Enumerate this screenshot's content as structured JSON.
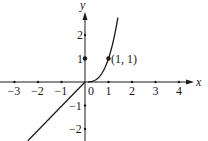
{
  "chart_data": {
    "type": "line",
    "title": "",
    "xlabel": "x",
    "ylabel": "y",
    "xlim": [
      -3.6,
      4.7
    ],
    "ylim": [
      -2.5,
      3.3
    ],
    "grid": false,
    "legend": null,
    "x_ticks": [
      -3,
      -2,
      -1,
      1,
      2,
      3,
      4
    ],
    "x_tick_labels": [
      "−3",
      "−2",
      "−1",
      "1",
      "2",
      "3",
      "4"
    ],
    "y_ticks": [
      2,
      1,
      -1,
      -2
    ],
    "y_tick_labels": [
      "2",
      "1",
      "−1",
      "−2"
    ],
    "origin_label": "0",
    "series": [
      {
        "name": "y = x (x < 0)",
        "x": [
          -2.43,
          0
        ],
        "y": [
          -2.5,
          0
        ]
      },
      {
        "name": "y = x^3 (x >= 0)",
        "x": [
          0.1,
          0.3,
          0.5,
          0.7,
          0.9,
          1.0,
          1.1,
          1.2,
          1.3,
          1.4
        ],
        "y": [
          0.001,
          0.027,
          0.125,
          0.343,
          0.729,
          1.0,
          1.331,
          1.728,
          2.197,
          2.744
        ]
      }
    ],
    "points": [
      {
        "x": 1,
        "y": 1,
        "label": "(1, 1)"
      },
      {
        "x": 0,
        "y": 1,
        "label": ""
      }
    ],
    "annotations": [
      {
        "text": "(1, 1)",
        "x": 1,
        "y": 1
      }
    ]
  },
  "layout": {
    "origin_px": [
      85,
      82
    ],
    "unit_px": 23.5
  },
  "labels": {
    "x_axis": "x",
    "y_axis": "y",
    "origin": "0",
    "point": "(1, 1)"
  },
  "colors": {
    "ink": "#1a1a1a",
    "background": "#ffffff"
  }
}
